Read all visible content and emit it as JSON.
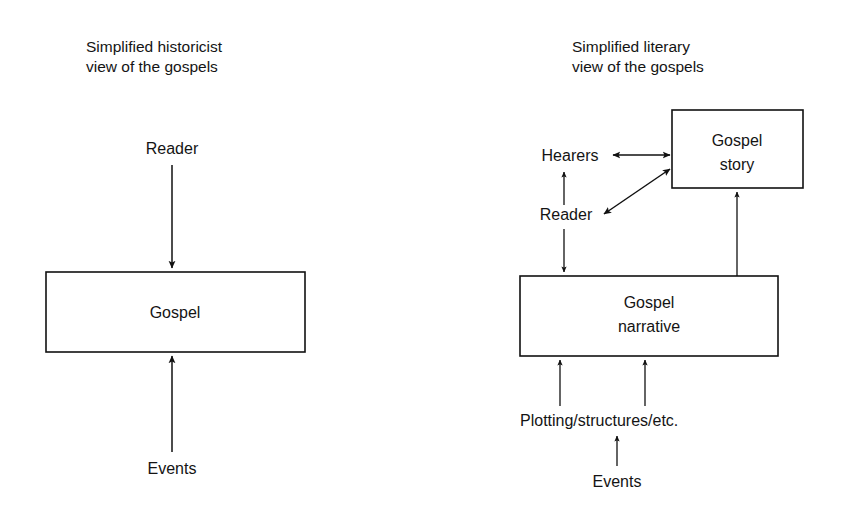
{
  "page": {
    "background": "#ffffff",
    "ink": "#111111",
    "width": 848,
    "height": 512
  },
  "panels": [
    {
      "id": "historicist",
      "title_line1": "Simplified historicist",
      "title_line2": "view of the gospels",
      "boxes": [
        {
          "id": "gospel",
          "label_line1": "Gospel",
          "label_line2": ""
        }
      ],
      "labels": [
        {
          "id": "reader",
          "text": "Reader"
        },
        {
          "id": "events",
          "text": "Events"
        }
      ],
      "edges": [
        {
          "id": "reader-to-gospel",
          "from": "Reader",
          "to": "Gospel",
          "direction": "down",
          "heads": 1
        },
        {
          "id": "events-to-gospel",
          "from": "Events",
          "to": "Gospel",
          "direction": "up",
          "heads": 1
        }
      ]
    },
    {
      "id": "literary",
      "title_line1": "Simplified literary",
      "title_line2": "view of the gospels",
      "boxes": [
        {
          "id": "gospel-story",
          "label_line1": "Gospel",
          "label_line2": "story"
        },
        {
          "id": "gospel-narrative",
          "label_line1": "Gospel",
          "label_line2": "narrative"
        }
      ],
      "labels": [
        {
          "id": "hearers",
          "text": "Hearers"
        },
        {
          "id": "reader",
          "text": "Reader"
        },
        {
          "id": "plotting",
          "text": "Plotting/structures/etc."
        },
        {
          "id": "events",
          "text": "Events"
        }
      ],
      "edges": [
        {
          "id": "hearers-story",
          "from": "Hearers",
          "to": "Gospel story",
          "direction": "horizontal",
          "heads": 2
        },
        {
          "id": "reader-story",
          "from": "Reader",
          "to": "Gospel story",
          "direction": "diagonal",
          "heads": 2
        },
        {
          "id": "reader-hearers",
          "from": "Reader",
          "to": "Hearers",
          "direction": "up",
          "heads": 1
        },
        {
          "id": "reader-narrative",
          "from": "Reader",
          "to": "Gospel narrative",
          "direction": "down",
          "heads": 1
        },
        {
          "id": "narrative-story",
          "from": "Gospel narrative",
          "to": "Gospel story",
          "direction": "up",
          "heads": 1
        },
        {
          "id": "plotting-narrative-left",
          "from": "Plotting/structures/etc.",
          "to": "Gospel narrative",
          "direction": "up",
          "heads": 1
        },
        {
          "id": "plotting-narrative-right",
          "from": "Plotting/structures/etc.",
          "to": "Gospel narrative",
          "direction": "up",
          "heads": 1
        },
        {
          "id": "events-plotting",
          "from": "Events",
          "to": "Plotting/structures/etc.",
          "direction": "up",
          "heads": 1
        }
      ]
    }
  ]
}
